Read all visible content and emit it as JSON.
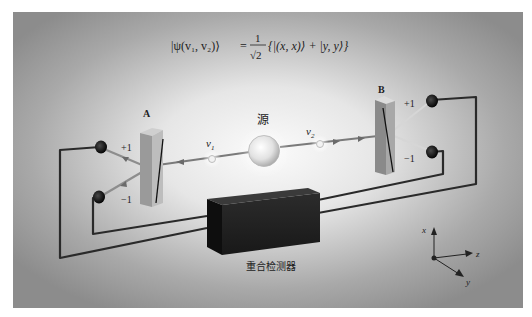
{
  "figure": {
    "formula": {
      "lhs": "|ψ(v₁, v₂)⟩",
      "equals": "=",
      "numerator": "1",
      "denominator": "√2",
      "rhs": "{|(x, x)⟩ + |y, y⟩}"
    },
    "analyzers": [
      {
        "id": "A",
        "label": "A",
        "plus_label": "+1",
        "minus_label": "−1"
      },
      {
        "id": "B",
        "label": "B",
        "plus_label": "+1",
        "minus_label": "−1"
      }
    ],
    "source": {
      "label": "源"
    },
    "photons": [
      {
        "label": "v",
        "subscript": "1"
      },
      {
        "label": "v",
        "subscript": "2"
      }
    ],
    "coincidence_detector": {
      "label": "重合检测器"
    },
    "axes": {
      "x_label": "x",
      "y_label": "y",
      "z_label": "z"
    },
    "colors": {
      "panel_edge": "#8e8e8e",
      "panel_center": "#f6f6f6",
      "wire": "#2a2a2a",
      "prism_front": "#8a8a8a",
      "prism_side": "#b8b8b8",
      "detector_box": "#1e1e1e",
      "beam": "#7a7a7a"
    }
  }
}
